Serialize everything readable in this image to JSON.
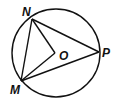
{
  "diagram": {
    "type": "circle-geometry",
    "circle": {
      "center_label": "O",
      "cx": 56,
      "cy": 53,
      "r": 44
    },
    "points": [
      {
        "id": "N",
        "label": "N",
        "x": 32,
        "y": 19,
        "label_x": 22,
        "label_y": 16
      },
      {
        "id": "M",
        "label": "M",
        "x": 21,
        "y": 81,
        "label_x": 11,
        "label_y": 94
      },
      {
        "id": "P",
        "label": "P",
        "x": 99,
        "y": 52,
        "label_x": 102,
        "label_y": 57
      },
      {
        "id": "O",
        "label": "O",
        "x": 55,
        "y": 53,
        "label_x": 60,
        "label_y": 60
      }
    ],
    "segments": [
      {
        "from": "N",
        "to": "M"
      },
      {
        "from": "N",
        "to": "P"
      },
      {
        "from": "M",
        "to": "P"
      },
      {
        "from": "N",
        "to": "O"
      },
      {
        "from": "M",
        "to": "O"
      }
    ],
    "colors": {
      "stroke": "#111111",
      "background": "#ffffff"
    }
  }
}
